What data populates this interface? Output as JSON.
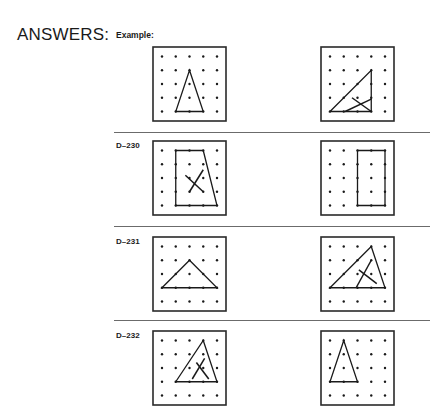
{
  "header": {
    "title": "ANSWERS:",
    "example_label": "Example:"
  },
  "rows": [
    {
      "label": "",
      "top": 46,
      "divider_after": 132,
      "left": {
        "shape": [
          [
            2,
            1
          ],
          [
            3,
            4
          ],
          [
            1,
            4
          ]
        ],
        "closed": true,
        "marks": []
      },
      "right": {
        "shape": [
          [
            0,
            4
          ],
          [
            3,
            1
          ],
          [
            3,
            4
          ]
        ],
        "closed": true,
        "marks": [
          [
            [
              1.1,
              4
            ],
            [
              3,
              3.1
            ]
          ],
          [
            [
              1.6,
              3.0
            ],
            [
              3,
              4
            ]
          ]
        ]
      }
    },
    {
      "label": "D–230",
      "top": 140,
      "divider_after": 226,
      "left": {
        "shape": [
          [
            1,
            0
          ],
          [
            3,
            0
          ],
          [
            4,
            4
          ],
          [
            1,
            4
          ]
        ],
        "closed": true,
        "marks": [
          [
            [
              3,
              1.4
            ],
            [
              2,
              3
            ]
          ],
          [
            [
              1.7,
              1.8
            ],
            [
              3,
              3
            ]
          ]
        ]
      },
      "right": {
        "shape": [
          [
            2,
            0
          ],
          [
            4,
            0
          ],
          [
            4,
            4
          ],
          [
            2,
            4
          ]
        ],
        "closed": true,
        "marks": []
      }
    },
    {
      "label": "D–231",
      "top": 236,
      "divider_after": 320,
      "left": {
        "shape": [
          [
            0,
            3
          ],
          [
            2,
            1
          ],
          [
            4,
            3
          ]
        ],
        "closed": true,
        "marks": []
      },
      "right": {
        "shape": [
          [
            0,
            3
          ],
          [
            3,
            0
          ],
          [
            4,
            3
          ]
        ],
        "closed": true,
        "marks": [
          [
            [
              3,
              1
            ],
            [
              1.9,
              3
            ]
          ],
          [
            [
              2.1,
              1.7
            ],
            [
              3.4,
              2.7
            ]
          ]
        ]
      }
    },
    {
      "label": "D–232",
      "top": 330,
      "divider_after": null,
      "left": {
        "shape": [
          [
            1,
            3
          ],
          [
            3,
            0
          ],
          [
            4,
            3
          ]
        ],
        "closed": true,
        "marks": [
          [
            [
              3.1,
              1.3
            ],
            [
              2.2,
              2.8
            ]
          ],
          [
            [
              2.5,
              1.6
            ],
            [
              3.4,
              2.8
            ]
          ]
        ]
      },
      "right": {
        "shape": [
          [
            1,
            0
          ],
          [
            0,
            3
          ],
          [
            2,
            3
          ]
        ],
        "closed": true,
        "marks": []
      }
    }
  ],
  "layout": {
    "left_board_x": 152,
    "right_board_x": 320,
    "grid_size": 5
  },
  "colors": {
    "ink": "#1a1a1a",
    "frame": "#2a2a2a",
    "divider": "#6b6b6b"
  }
}
